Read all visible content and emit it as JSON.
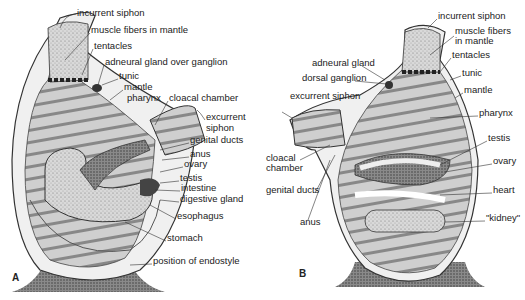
{
  "figure": {
    "panel_a": {
      "letter": "A",
      "labels": [
        {
          "text": "incurrent siphon",
          "x": 77,
          "y": 13
        },
        {
          "text": "muscle fibers in mantle",
          "x": 91,
          "y": 30
        },
        {
          "text": "tentacles",
          "x": 94,
          "y": 46
        },
        {
          "text": "adneural gland over ganglion",
          "x": 105,
          "y": 62
        },
        {
          "text": "tunic",
          "x": 119,
          "y": 76
        },
        {
          "text": "mantle",
          "x": 124,
          "y": 87
        },
        {
          "text": "pharynx",
          "x": 127,
          "y": 98
        },
        {
          "text": "cloacal chamber",
          "x": 169,
          "y": 98
        },
        {
          "text": "excurrent",
          "x": 206,
          "y": 117
        },
        {
          "text": "siphon",
          "x": 206,
          "y": 128
        },
        {
          "text": "genital ducts",
          "x": 190,
          "y": 140
        },
        {
          "text": "anus",
          "x": 190,
          "y": 154
        },
        {
          "text": "ovary",
          "x": 184,
          "y": 164
        },
        {
          "text": "testis",
          "x": 180,
          "y": 178
        },
        {
          "text": "intestine",
          "x": 181,
          "y": 188
        },
        {
          "text": "digestive gland",
          "x": 180,
          "y": 199
        },
        {
          "text": "esophagus",
          "x": 177,
          "y": 216
        },
        {
          "text": "stomach",
          "x": 167,
          "y": 238
        },
        {
          "text": "position of endostyle",
          "x": 153,
          "y": 261
        }
      ]
    },
    "panel_b": {
      "letter": "B",
      "labels": [
        {
          "text": "incurrent siphon",
          "x": 438,
          "y": 16
        },
        {
          "text": "muscle fibers",
          "x": 455,
          "y": 31
        },
        {
          "text": "in mantle",
          "x": 455,
          "y": 41
        },
        {
          "text": "tentacles",
          "x": 452,
          "y": 55
        },
        {
          "text": "adneural gland",
          "x": 312,
          "y": 63
        },
        {
          "text": "dorsal ganglion",
          "x": 302,
          "y": 78
        },
        {
          "text": "tunic",
          "x": 462,
          "y": 73
        },
        {
          "text": "excurrent siphon",
          "x": 290,
          "y": 96
        },
        {
          "text": "mantle",
          "x": 464,
          "y": 90
        },
        {
          "text": "pharynx",
          "x": 479,
          "y": 113
        },
        {
          "text": "testis",
          "x": 488,
          "y": 138
        },
        {
          "text": "cloacal",
          "x": 266,
          "y": 158
        },
        {
          "text": "chamber",
          "x": 266,
          "y": 168
        },
        {
          "text": "ovary",
          "x": 493,
          "y": 161
        },
        {
          "text": "genital ducts",
          "x": 266,
          "y": 190
        },
        {
          "text": "heart",
          "x": 493,
          "y": 190
        },
        {
          "text": "\"kidney\"",
          "x": 486,
          "y": 218
        },
        {
          "text": "anus",
          "x": 300,
          "y": 222
        }
      ]
    }
  }
}
